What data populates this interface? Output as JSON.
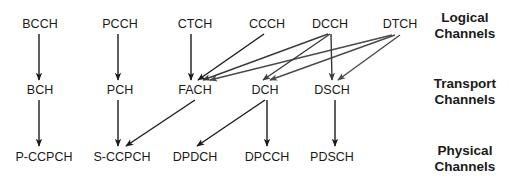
{
  "diagram": {
    "layers": [
      {
        "id": "logical",
        "line1": "Logical",
        "line2": "Channels",
        "x": 465,
        "y": 24
      },
      {
        "id": "transport",
        "line1": "Transport",
        "line2": "Channels",
        "x": 465,
        "y": 90
      },
      {
        "id": "physical",
        "line1": "Physical",
        "line2": "Channels",
        "x": 465,
        "y": 157
      }
    ],
    "nodes": [
      {
        "id": "BCCH",
        "label": "BCCH",
        "x": 40,
        "y": 24
      },
      {
        "id": "PCCH",
        "label": "PCCH",
        "x": 120,
        "y": 24
      },
      {
        "id": "CTCH",
        "label": "CTCH",
        "x": 195,
        "y": 24
      },
      {
        "id": "CCCH",
        "label": "CCCH",
        "x": 267,
        "y": 24
      },
      {
        "id": "DCCH",
        "label": "DCCH",
        "x": 330,
        "y": 24
      },
      {
        "id": "DTCH",
        "label": "DTCH",
        "x": 400,
        "y": 24
      },
      {
        "id": "BCH",
        "label": "BCH",
        "x": 40,
        "y": 90
      },
      {
        "id": "PCH",
        "label": "PCH",
        "x": 120,
        "y": 90
      },
      {
        "id": "FACH",
        "label": "FACH",
        "x": 195,
        "y": 90
      },
      {
        "id": "DCH",
        "label": "DCH",
        "x": 265,
        "y": 90
      },
      {
        "id": "DSCH",
        "label": "DSCH",
        "x": 332,
        "y": 90
      },
      {
        "id": "P-CCPCH",
        "label": "P-CCPCH",
        "x": 44,
        "y": 157
      },
      {
        "id": "S-CCPCH",
        "label": "S-CCPCH",
        "x": 122,
        "y": 157
      },
      {
        "id": "DPDCH",
        "label": "DPDCH",
        "x": 195,
        "y": 157
      },
      {
        "id": "DPCCH",
        "label": "DPCCH",
        "x": 267,
        "y": 157
      },
      {
        "id": "PDSCH",
        "label": "PDSCH",
        "x": 332,
        "y": 157
      }
    ],
    "edges": [
      {
        "from": "BCCH",
        "to": "BCH",
        "x1": 39,
        "y1": 34,
        "x2": 39,
        "y2": 80,
        "color": "#1a1a1a"
      },
      {
        "from": "PCCH",
        "to": "PCH",
        "x1": 118,
        "y1": 34,
        "x2": 118,
        "y2": 80,
        "color": "#1a1a1a"
      },
      {
        "from": "CTCH",
        "to": "FACH",
        "x1": 191,
        "y1": 34,
        "x2": 191,
        "y2": 80,
        "color": "#1a1a1a"
      },
      {
        "from": "CCCH",
        "to": "FACH",
        "x1": 264,
        "y1": 34,
        "x2": 198,
        "y2": 80,
        "color": "#1a1a1a"
      },
      {
        "from": "DCCH",
        "to": "FACH",
        "x1": 328,
        "y1": 34,
        "x2": 203,
        "y2": 80,
        "color": "#3a3a3a"
      },
      {
        "from": "DTCH",
        "to": "FACH",
        "x1": 392,
        "y1": 35,
        "x2": 210,
        "y2": 80,
        "color": "#4a4a4a"
      },
      {
        "from": "DCCH",
        "to": "DCH",
        "x1": 330,
        "y1": 34,
        "x2": 263,
        "y2": 80,
        "color": "#3a3a3a"
      },
      {
        "from": "DTCH",
        "to": "DCH",
        "x1": 395,
        "y1": 35,
        "x2": 270,
        "y2": 80,
        "color": "#4a4a4a"
      },
      {
        "from": "DCCH",
        "to": "DSCH",
        "x1": 331,
        "y1": 34,
        "x2": 332,
        "y2": 80,
        "color": "#3a3a3a"
      },
      {
        "from": "DTCH",
        "to": "DSCH",
        "x1": 400,
        "y1": 35,
        "x2": 338,
        "y2": 80,
        "color": "#4a4a4a"
      },
      {
        "from": "BCH",
        "to": "P-CCPCH",
        "x1": 39,
        "y1": 100,
        "x2": 39,
        "y2": 146,
        "color": "#1a1a1a"
      },
      {
        "from": "PCH",
        "to": "S-CCPCH",
        "x1": 118,
        "y1": 100,
        "x2": 118,
        "y2": 146,
        "color": "#1a1a1a"
      },
      {
        "from": "FACH",
        "to": "S-CCPCH",
        "x1": 195,
        "y1": 100,
        "x2": 126,
        "y2": 146,
        "color": "#1a1a1a"
      },
      {
        "from": "DCH",
        "to": "DPDCH",
        "x1": 265,
        "y1": 100,
        "x2": 197,
        "y2": 146,
        "color": "#1a1a1a"
      },
      {
        "from": "DCH",
        "to": "DPCCH",
        "x1": 267,
        "y1": 100,
        "x2": 267,
        "y2": 146,
        "color": "#1a1a1a"
      },
      {
        "from": "DSCH",
        "to": "PDSCH",
        "x1": 335,
        "y1": 100,
        "x2": 335,
        "y2": 146,
        "color": "#1a1a1a"
      }
    ]
  }
}
